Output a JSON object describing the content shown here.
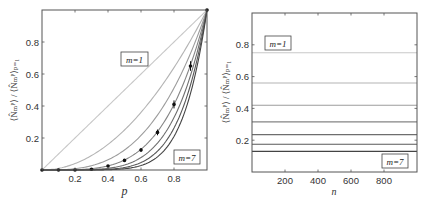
{
  "chart_data": [
    {
      "type": "line",
      "panel": "left",
      "xlabel": "p",
      "ylabel": "⟨N̂ₘᴾ⟩ / ⟨N̂ₘᴾ⟩ₚ₌₁",
      "xlim": [
        0,
        1
      ],
      "ylim": [
        0,
        1
      ],
      "xticks": [
        "0.2",
        "0.4",
        "0.6",
        "0.8"
      ],
      "yticks": [
        "0.2",
        "0.4",
        "0.6",
        "0.8"
      ],
      "grid": false,
      "annotations": [
        {
          "text": "m=1",
          "position": "upper-middle"
        },
        {
          "text": "m=7",
          "position": "lower-right"
        }
      ],
      "series": [
        {
          "name": "m=1",
          "formula": "p^1",
          "color": "#c8c8c8"
        },
        {
          "name": "m=2",
          "formula": "p^2",
          "color": "#b4b4b4"
        },
        {
          "name": "m=3",
          "formula": "p^3",
          "color": "#9c9c9c"
        },
        {
          "name": "m=4",
          "formula": "p^4",
          "color": "#848484"
        },
        {
          "name": "m=5",
          "formula": "p^5",
          "color": "#6e6e6e"
        },
        {
          "name": "m=6",
          "formula": "p^6",
          "color": "#585858"
        },
        {
          "name": "m=7",
          "formula": "p^7",
          "color": "#444444"
        }
      ],
      "points": {
        "name": "measured",
        "x": [
          0.0,
          0.1,
          0.2,
          0.3,
          0.4,
          0.5,
          0.6,
          0.7,
          0.8,
          0.9,
          1.0
        ],
        "y": [
          0.0,
          0.0,
          0.0,
          0.005,
          0.025,
          0.06,
          0.125,
          0.235,
          0.41,
          0.65,
          1.0
        ],
        "err": [
          0,
          0,
          0,
          0,
          0.005,
          0.008,
          0.012,
          0.018,
          0.025,
          0.03,
          0
        ]
      }
    },
    {
      "type": "line",
      "panel": "right",
      "xlabel": "n",
      "ylabel": "⟨N̂ₘᴾ⟩ / ⟨N̂ₘᴾ⟩ₚ₌₁",
      "xlim": [
        0,
        1000
      ],
      "ylim": [
        0,
        1
      ],
      "xticks": [
        "200",
        "400",
        "600",
        "800"
      ],
      "yticks": [
        "0.2",
        "0.4",
        "0.6",
        "0.8"
      ],
      "grid": false,
      "annotations": [
        {
          "text": "m=1",
          "position": "upper-left"
        },
        {
          "text": "m=7",
          "position": "lower-right"
        }
      ],
      "series": [
        {
          "name": "m=1",
          "value": 0.75,
          "color": "#c8c8c8"
        },
        {
          "name": "m=2",
          "value": 0.56,
          "color": "#b4b4b4"
        },
        {
          "name": "m=3",
          "value": 0.42,
          "color": "#9c9c9c"
        },
        {
          "name": "m=4",
          "value": 0.315,
          "color": "#848484"
        },
        {
          "name": "m=5",
          "value": 0.235,
          "color": "#6e6e6e"
        },
        {
          "name": "m=6",
          "value": 0.175,
          "color": "#585858"
        },
        {
          "name": "m=7",
          "value": 0.13,
          "color": "#444444"
        }
      ]
    }
  ],
  "left": {
    "xlabel": "p",
    "ylabel_main": "⟨N̂",
    "ylabel_full": "⟨N̂ₘᴾ⟩ / ⟨N̂ₘᴾ⟩ₚ₌₁",
    "xticks": [
      {
        "v": 0.2,
        "label": "0.2"
      },
      {
        "v": 0.4,
        "label": "0.4"
      },
      {
        "v": 0.6,
        "label": "0.6"
      },
      {
        "v": 0.8,
        "label": "0.8"
      }
    ],
    "yticks": [
      {
        "v": 0.2,
        "label": "0.2"
      },
      {
        "v": 0.4,
        "label": "0.4"
      },
      {
        "v": 0.6,
        "label": "0.6"
      },
      {
        "v": 0.8,
        "label": "0.8"
      }
    ],
    "ann_top": "m=1",
    "ann_bottom": "m=7"
  },
  "right": {
    "xlabel": "n",
    "ylabel_full": "⟨N̂ₘᴾ⟩ / ⟨N̂ₘᴾ⟩ₚ₌₁",
    "ann_top": "m=1",
    "ann_bottom": "m=7"
  }
}
